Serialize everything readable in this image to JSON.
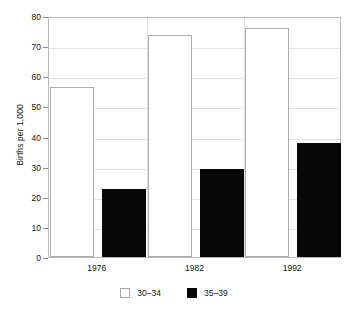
{
  "chart_data": {
    "type": "bar",
    "title": "",
    "xlabel": "",
    "ylabel": "Births per 1,000",
    "categories": [
      "1976",
      "1982",
      "1992"
    ],
    "series": [
      {
        "name": "30–34",
        "style": "open",
        "color": "#ffffff",
        "values": [
          56.5,
          73.8,
          76.0
        ]
      },
      {
        "name": "35–39",
        "style": "solid",
        "color": "#080808",
        "values": [
          22.6,
          29.2,
          37.9
        ]
      }
    ],
    "ylim": [
      0,
      80
    ],
    "yticks": [
      0,
      10,
      20,
      30,
      40,
      50,
      60,
      70,
      80
    ],
    "ytick_labels": [
      "0",
      "10",
      "20",
      "30",
      "40",
      "50",
      "60",
      "70",
      "80"
    ],
    "grid": true,
    "legend_position": "bottom"
  },
  "axis": {
    "y_title": "Births per 1,000"
  },
  "legend": {
    "items": [
      {
        "label": "30–34"
      },
      {
        "label": "35–39"
      }
    ]
  }
}
